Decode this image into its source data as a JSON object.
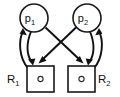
{
  "diagram": {
    "type": "petri-net",
    "title": "",
    "colors": {
      "stroke": "#111111",
      "fill": "#ffffff",
      "text": "#111111"
    },
    "places": [
      {
        "id": "p1",
        "label": "p",
        "subscript": "1",
        "shape": "circle",
        "cx": 34,
        "cy": 18,
        "r": 14
      },
      {
        "id": "p2",
        "label": "p",
        "subscript": "2",
        "shape": "circle",
        "cx": 87,
        "cy": 18,
        "r": 14
      }
    ],
    "resources": [
      {
        "id": "R1",
        "label": "R",
        "subscript": "1",
        "shape": "square",
        "x": 27,
        "y": 66,
        "width": 27,
        "height": 26,
        "token": "o",
        "token_count": 1,
        "label_position": "left"
      },
      {
        "id": "R2",
        "label": "R",
        "subscript": "2",
        "shape": "square",
        "x": 68,
        "y": 66,
        "width": 27,
        "height": 26,
        "token": "o",
        "token_count": 1,
        "label_position": "right"
      }
    ],
    "edges": [
      {
        "id": "e1",
        "from": "R1",
        "to": "p1",
        "style": "curved",
        "side": "left",
        "direction": "up"
      },
      {
        "id": "e2",
        "from": "p1",
        "to": "R1",
        "style": "curved",
        "side": "left",
        "direction": "down"
      },
      {
        "id": "e3",
        "from": "R2",
        "to": "p2",
        "style": "curved",
        "side": "right",
        "direction": "up"
      },
      {
        "id": "e4",
        "from": "p2",
        "to": "R2",
        "style": "curved",
        "side": "right",
        "direction": "down"
      },
      {
        "id": "e5",
        "from": "p1",
        "to": "R2",
        "style": "straight",
        "direction": "diagonal-down-right"
      },
      {
        "id": "e6",
        "from": "p2",
        "to": "R1",
        "style": "straight",
        "direction": "diagonal-down-left"
      }
    ]
  }
}
